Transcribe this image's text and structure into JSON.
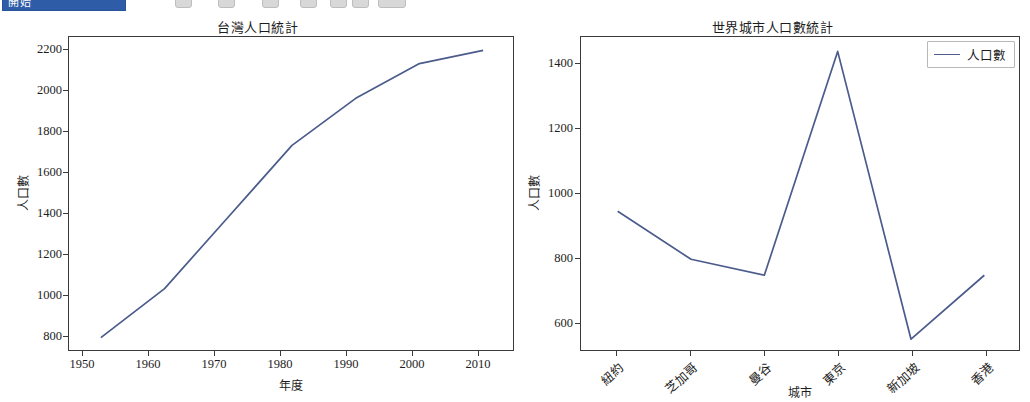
{
  "toolbar": {
    "active_tab_label": "開始",
    "icons": [
      "save-icon",
      "undo-icon",
      "redo-icon",
      "cut-icon",
      "copy-icon",
      "paste-icon",
      "format-icon"
    ]
  },
  "figure": {
    "line_color": "#4b5c8c",
    "axis_color": "#3a3a3a",
    "background": "#ffffff"
  },
  "legend": {
    "entry_label": "人口數"
  },
  "chart_data": [
    {
      "type": "line",
      "title": "台灣人口統計",
      "xlabel": "年度",
      "ylabel": "人口數",
      "x": [
        1950,
        1960,
        1970,
        1980,
        1990,
        2000,
        2010
      ],
      "values": [
        860,
        1100,
        1450,
        1800,
        2030,
        2200,
        2265
      ],
      "xticks": [
        "1950",
        "1960",
        "1970",
        "1980",
        "1990",
        "2000",
        "2010"
      ],
      "yticks": [
        "800",
        "1000",
        "1200",
        "1400",
        "1600",
        "1800",
        "2000",
        "2200"
      ],
      "xlim": [
        1945,
        2015
      ],
      "ylim": [
        790,
        2330
      ],
      "grid": false,
      "legend": false,
      "series": [
        {
          "name": "人口數",
          "values": [
            860,
            1100,
            1450,
            1800,
            2030,
            2200,
            2265
          ]
        }
      ]
    },
    {
      "type": "line",
      "title": "世界城市人口數統計",
      "xlabel": "城市",
      "ylabel": "人口數",
      "categories": [
        "紐約",
        "芝加哥",
        "曼谷",
        "東京",
        "新加坡",
        "香港"
      ],
      "values": [
        1000,
        850,
        800,
        1500,
        600,
        800
      ],
      "xticks": [
        "紐約",
        "芝加哥",
        "曼谷",
        "東京",
        "新加坡",
        "香港"
      ],
      "yticks": [
        "600",
        "800",
        "1000",
        "1200",
        "1400"
      ],
      "ylim": [
        560,
        1545
      ],
      "grid": false,
      "legend": true,
      "legend_position": "upper right",
      "series": [
        {
          "name": "人口數",
          "values": [
            1000,
            850,
            800,
            1500,
            600,
            800
          ]
        }
      ]
    }
  ]
}
